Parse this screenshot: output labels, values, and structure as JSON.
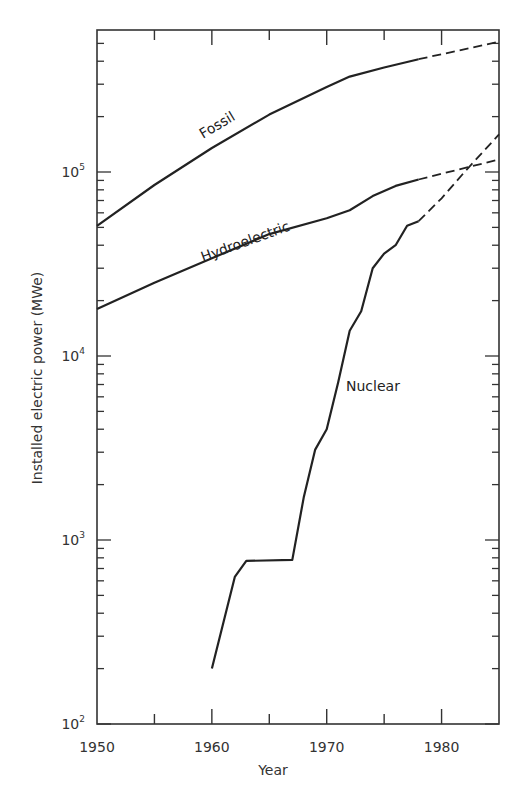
{
  "chart_data": {
    "type": "line",
    "title": "",
    "xlabel": "Year",
    "ylabel": "Installed electric power (MWe)",
    "xlim": [
      1950,
      1985
    ],
    "ylim": [
      100,
      600000
    ],
    "yscale": "log",
    "grid": false,
    "x_ticks": [
      1950,
      1960,
      1970,
      1980
    ],
    "x_tick_labels": [
      "1950",
      "1960",
      "1970",
      "1980"
    ],
    "y_tick_labels": [
      {
        "base": "10",
        "exp": "2",
        "value": 100
      },
      {
        "base": "10",
        "exp": "3",
        "value": 1000
      },
      {
        "base": "10",
        "exp": "4",
        "value": 10000
      },
      {
        "base": "10",
        "exp": "5",
        "value": 100000
      }
    ],
    "series": [
      {
        "name": "Fossil",
        "style": "solid",
        "x": [
          1950,
          1955,
          1960,
          1965,
          1970,
          1972,
          1975,
          1978
        ],
        "values": [
          51000,
          85000,
          135000,
          205000,
          290000,
          330000,
          370000,
          410000
        ],
        "projection": {
          "style": "dashed",
          "x": [
            1978,
            1985
          ],
          "values": [
            410000,
            510000
          ]
        }
      },
      {
        "name": "Hydroelectric",
        "style": "solid",
        "x": [
          1950,
          1955,
          1960,
          1965,
          1970,
          1972,
          1974,
          1976,
          1978
        ],
        "values": [
          18000,
          25000,
          34000,
          46000,
          56000,
          62000,
          74000,
          84000,
          91000
        ],
        "projection": {
          "style": "dashed",
          "x": [
            1978,
            1985
          ],
          "values": [
            91000,
            117000
          ]
        }
      },
      {
        "name": "Nuclear",
        "style": "solid",
        "x": [
          1960,
          1962,
          1963,
          1967,
          1968,
          1969,
          1970,
          1971,
          1972,
          1973,
          1974,
          1975,
          1976,
          1977,
          1978
        ],
        "values": [
          200,
          630,
          770,
          780,
          1700,
          3100,
          4000,
          7200,
          13700,
          17500,
          30000,
          36000,
          40000,
          51000,
          54000
        ],
        "projection": {
          "style": "dashed",
          "x": [
            1978,
            1980,
            1982,
            1985
          ],
          "values": [
            54000,
            72000,
            100000,
            160000
          ]
        }
      }
    ],
    "annotations": [
      "Fossil",
      "Hydroelectric",
      "Nuclear"
    ],
    "legend": "none (inline labels)"
  },
  "labels": {
    "fossil": "Fossil",
    "hydro": "Hydroelectric",
    "nuclear": "Nuclear",
    "xlabel": "Year",
    "ylabel": "Installed electric power (MWe)"
  },
  "colors": {
    "line": "#222222",
    "axis": "#333333",
    "background": "#ffffff"
  }
}
